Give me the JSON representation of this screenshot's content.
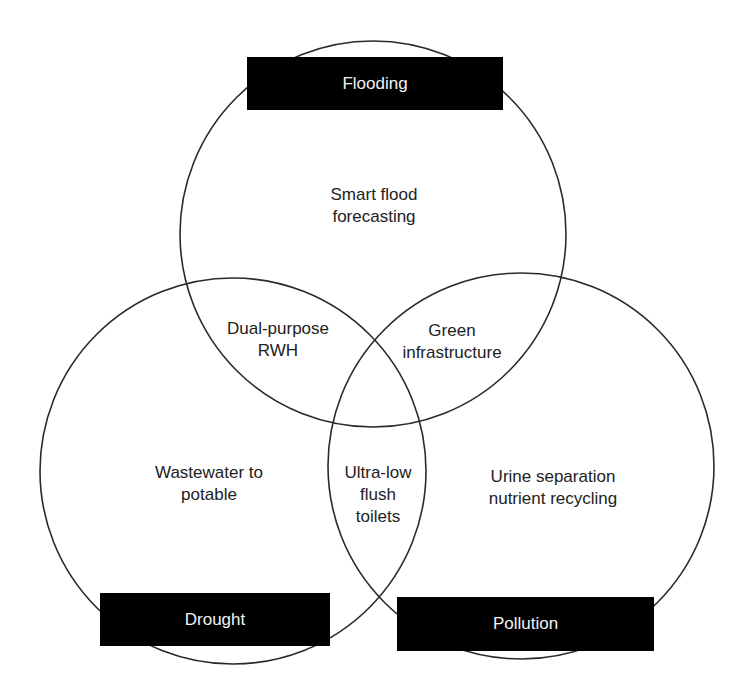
{
  "diagram": {
    "type": "venn",
    "sets": [
      {
        "id": "flooding",
        "label": "Flooding"
      },
      {
        "id": "drought",
        "label": "Drought"
      },
      {
        "id": "pollution",
        "label": "Pollution"
      }
    ],
    "regions": {
      "flooding_only": [
        "Smart flood",
        "forecasting"
      ],
      "flooding_drought": [
        "Dual-purpose",
        "RWH"
      ],
      "flooding_pollution": [
        "Green",
        "infrastructure"
      ],
      "drought_pollution": [
        "Ultra-low",
        "flush",
        "toilets"
      ],
      "drought_only": [
        "Wastewater to",
        "potable"
      ],
      "pollution_only": [
        "Urine separation",
        "nutrient recycling"
      ]
    },
    "colors": {
      "stroke": "#2a2a2a",
      "label_bg": "#000000",
      "label_text": "#f2f2f2",
      "text": "#222222"
    }
  }
}
